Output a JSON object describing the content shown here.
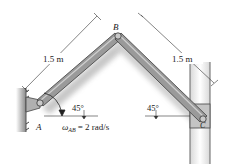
{
  "figure": {
    "points": {
      "A": "A",
      "B": "B",
      "C": "C"
    },
    "dimensions": {
      "ab_length": "1.5 m",
      "bc_length": "1.5 m"
    },
    "angles": {
      "at_a": "45°",
      "at_c": "45°"
    },
    "angular_velocity": {
      "symbol": "ω",
      "subscript": "AB",
      "value_text": "= 2 rad/s"
    },
    "colors": {
      "link_fill": "#9a9a9a",
      "link_edge": "#3c3c3c",
      "wall_fill": "#8c8c8c",
      "block_fill": "#c9c9c9",
      "line": "#333333"
    }
  }
}
